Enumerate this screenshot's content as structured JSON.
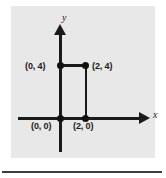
{
  "figure": {
    "panel_background": "#e8e8e8",
    "ink_color": "#1a1a1a",
    "page_background": "#ffffff"
  },
  "axes": {
    "x_label": "x",
    "y_label": "y",
    "x_arrow_icon": "arrow-right-icon",
    "y_arrow_icon": "arrow-up-icon"
  },
  "chart_data": {
    "type": "scatter",
    "title": "",
    "xlabel": "x",
    "ylabel": "y",
    "grid": false,
    "legend": false,
    "xlim": [
      -2,
      5
    ],
    "ylim": [
      -3,
      6
    ],
    "points": [
      {
        "label": "(0, 4)",
        "x": 0,
        "y": 4,
        "label_position": "left"
      },
      {
        "label": "(2, 4)",
        "x": 2,
        "y": 4,
        "label_position": "right"
      },
      {
        "label": "(0, 0)",
        "x": 0,
        "y": 0,
        "label_position": "below-left"
      },
      {
        "label": "(2, 0)",
        "x": 2,
        "y": 0,
        "label_position": "below"
      }
    ],
    "segments": [
      {
        "name": "top-segment",
        "from": [
          0,
          4
        ],
        "to": [
          2,
          4
        ]
      },
      {
        "name": "right-segment",
        "from": [
          2,
          4
        ],
        "to": [
          2,
          0
        ]
      }
    ]
  },
  "footer": {
    "rule": ""
  }
}
